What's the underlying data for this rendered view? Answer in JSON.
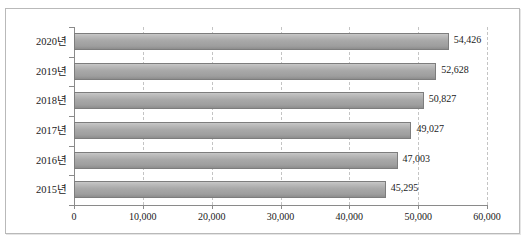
{
  "ghost": {
    "clipped_text_above": ""
  },
  "chart_data": {
    "type": "bar",
    "orientation": "horizontal",
    "title": "",
    "subtitle": "",
    "xlabel": "",
    "ylabel": "",
    "categories": [
      "2015년",
      "2016년",
      "2017년",
      "2018년",
      "2019년",
      "2020년"
    ],
    "values": [
      45295,
      47003,
      49027,
      50827,
      52628,
      54426
    ],
    "value_labels": [
      "45,295",
      "47,003",
      "49,027",
      "50,827",
      "52,628",
      "54,426"
    ],
    "display_order_top_to_bottom": [
      "2020년",
      "2019년",
      "2018년",
      "2017년",
      "2016년",
      "2015년"
    ],
    "xlim": [
      0,
      60000
    ],
    "xtick_values": [
      0,
      10000,
      20000,
      30000,
      40000,
      50000,
      60000
    ],
    "xtick_labels": [
      "0",
      "10,000",
      "20,000",
      "30,000",
      "40,000",
      "50,000",
      "60,000"
    ],
    "grid": true,
    "grid_axis": "x",
    "grid_style": "dashed",
    "legend": false,
    "legend_position": "none",
    "series": [
      {
        "name": "",
        "values": [
          45295,
          47003,
          49027,
          50827,
          52628,
          54426
        ]
      }
    ],
    "colors": {
      "bar_top": "#c8c8c8",
      "bar_bottom": "#8d8d8d",
      "bar_border": "#7d7d7d",
      "gridline": "#c4c4c4",
      "axis": "#8a8a8a",
      "text": "#1a1a1a",
      "frame_border": "#b9b9b9",
      "background": "#ffffff"
    }
  }
}
